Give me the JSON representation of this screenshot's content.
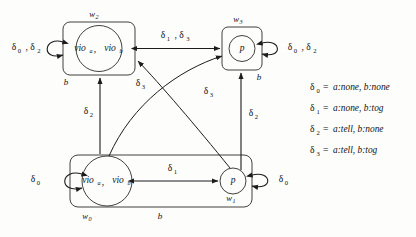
{
  "diagram": {
    "stroke_color": "#1c1c1c",
    "background_color": "#fdfdfc",
    "worlds": [
      {
        "id": "w2",
        "label": "w",
        "sub": "2",
        "state_label": "vio",
        "state_sub_a": "a",
        "state_sep": ",",
        "state_label_b": "vio",
        "state_sub_b": "b",
        "accessibility_label": "b"
      },
      {
        "id": "w3",
        "label": "w",
        "sub": "3",
        "state_label": "p",
        "accessibility_label": "b"
      },
      {
        "id": "w0",
        "label": "w",
        "sub": "0",
        "state_label": "vio",
        "state_sub_a": "a",
        "state_sep": ",",
        "state_label_b": "vio",
        "state_sub_b": "b"
      },
      {
        "id": "w1",
        "label": "w",
        "sub": "1",
        "state_label": "p",
        "accessibility_label": "b"
      }
    ],
    "edge_labels": {
      "loop_w2": {
        "text": "δ",
        "sub": "0",
        "text2": ", δ",
        "sub2": "2"
      },
      "loop_w3": {
        "text": "δ",
        "sub": "0",
        "text2": ", δ",
        "sub2": "2"
      },
      "loop_w0": {
        "text": "δ",
        "sub": "0"
      },
      "loop_w1": {
        "text": "δ",
        "sub": "0"
      },
      "top_edge": {
        "text": "δ",
        "sub": "1",
        "text2": ", δ",
        "sub2": "3"
      },
      "bottom_edge": {
        "text": "δ",
        "sub": "1"
      },
      "left_vertical": {
        "text": "δ",
        "sub": "2"
      },
      "right_vertical": {
        "text": "δ",
        "sub": "2"
      },
      "arc_left": {
        "text": "δ",
        "sub": "3"
      },
      "arc_right": {
        "text": "δ",
        "sub": "3"
      }
    },
    "legend": [
      {
        "symbol": "δ",
        "sub": "0",
        "eq": "=",
        "definition": "a:none, b:none"
      },
      {
        "symbol": "δ",
        "sub": "1",
        "eq": "=",
        "definition": "a:none, b:tog"
      },
      {
        "symbol": "δ",
        "sub": "2",
        "eq": "=",
        "definition": "a:tell, b:none"
      },
      {
        "symbol": "δ",
        "sub": "3",
        "eq": "=",
        "definition": "a:tell, b:tog"
      }
    ]
  }
}
